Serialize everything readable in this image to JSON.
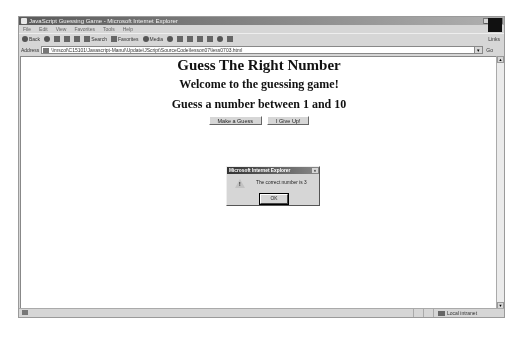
{
  "window": {
    "title": "JavaScript Guessing Game - Microsoft Internet Explorer",
    "controls": [
      "_",
      "□",
      "×"
    ]
  },
  "menubar": {
    "items": [
      "File",
      "Edit",
      "View",
      "Favorites",
      "Tools",
      "Help"
    ]
  },
  "toolbar": {
    "back_label": "Back",
    "search_label": "Search",
    "favorites_label": "Favorites",
    "media_label": "Media",
    "links_label": "Links"
  },
  "addressbar": {
    "label": "Address",
    "url": "\\\\mscol\\C15101\\Javascript-Manul\\Update\\JScript\\SourceCode\\lesson07\\less0703.html",
    "go_label": "Go"
  },
  "page": {
    "title": "Guess The Right Number",
    "welcome": "Welcome to the guessing game!",
    "prompt": "Guess a number between 1 and 10",
    "buttons": {
      "guess": "Make a Guess",
      "give_up": "I Give Up!"
    }
  },
  "dialog": {
    "title": "Microsoft Internet Explorer",
    "close": "×",
    "message": "The correct number is 3",
    "icon": "warning-icon",
    "ok_label": "OK"
  },
  "statusbar": {
    "zone_label": "Local intranet"
  }
}
